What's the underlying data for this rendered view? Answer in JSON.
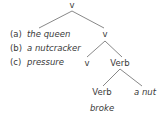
{
  "tree": {
    "root": "v",
    "v2": "v",
    "v3": "v",
    "verb1": "Verb",
    "verb2": "Verb",
    "object": "a nut",
    "verb_word": "broke"
  },
  "options": [
    {
      "marker": "(a)",
      "text": "the queen"
    },
    {
      "marker": "(b)",
      "text": "a nutcracker"
    },
    {
      "marker": "(c)",
      "text": "pressure"
    }
  ]
}
